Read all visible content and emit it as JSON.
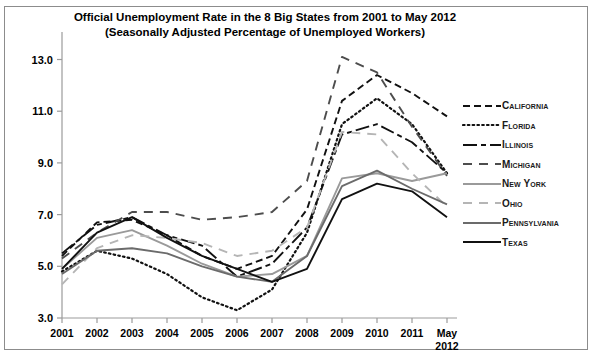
{
  "top_fragment": "",
  "chart_data": {
    "type": "line",
    "title": "Official Unemployment Rate in the 8 Big States from 2001 to May 2012",
    "subtitle": "(Seasonally Adjusted Percentage of Unemployed Workers)",
    "xlabel": "",
    "ylabel": "",
    "grid": false,
    "legend_position": "right",
    "categories": [
      "2001",
      "2002",
      "2003",
      "2004",
      "2005",
      "2006",
      "2007",
      "2008",
      "2009",
      "2010",
      "2011",
      "May\n2012"
    ],
    "x_tick_labels": [
      "2001",
      "2002",
      "2003",
      "2004",
      "2005",
      "2006",
      "2007",
      "2008",
      "2009",
      "2010",
      "2011",
      "May 2012"
    ],
    "y_tick_labels": [
      "3.0",
      "5.0",
      "7.0",
      "9.0",
      "11.0",
      "13.0"
    ],
    "y_ticks": [
      3.0,
      5.0,
      7.0,
      9.0,
      11.0,
      13.0
    ],
    "ylim": [
      3.0,
      13.6
    ],
    "series": [
      {
        "name": "California",
        "style": "dashed",
        "color": "#111111",
        "values": [
          5.4,
          6.7,
          6.8,
          6.2,
          5.4,
          4.9,
          5.4,
          7.2,
          11.4,
          12.4,
          11.7,
          10.8
        ]
      },
      {
        "name": "Florida",
        "style": "dotted",
        "color": "#111111",
        "values": [
          4.8,
          5.6,
          5.3,
          4.7,
          3.8,
          3.3,
          4.1,
          6.3,
          10.5,
          11.5,
          10.5,
          8.6
        ]
      },
      {
        "name": "Illinois",
        "style": "dash-dot",
        "color": "#111111",
        "values": [
          5.5,
          6.6,
          6.9,
          6.2,
          5.8,
          4.6,
          5.1,
          6.5,
          10.1,
          10.5,
          9.8,
          8.6
        ]
      },
      {
        "name": "Michigan",
        "style": "long-dash",
        "color": "#4d4d4d",
        "values": [
          5.3,
          6.3,
          7.1,
          7.1,
          6.8,
          6.9,
          7.1,
          8.3,
          13.1,
          12.5,
          10.4,
          8.5
        ]
      },
      {
        "name": "New York",
        "style": "solid",
        "color": "#9a9a9a",
        "values": [
          4.9,
          6.1,
          6.4,
          5.8,
          5.1,
          4.6,
          4.7,
          5.4,
          8.4,
          8.6,
          8.3,
          8.6
        ]
      },
      {
        "name": "Ohio",
        "style": "long-dash",
        "color": "#b5b5b5",
        "values": [
          4.3,
          5.7,
          6.2,
          6.1,
          5.9,
          5.4,
          5.6,
          6.5,
          10.2,
          10.1,
          8.6,
          7.3
        ]
      },
      {
        "name": "Pennsylvania",
        "style": "solid",
        "color": "#6b6b6b",
        "values": [
          4.7,
          5.6,
          5.7,
          5.5,
          5.0,
          4.6,
          4.4,
          5.4,
          8.1,
          8.7,
          8.0,
          7.4
        ]
      },
      {
        "name": "Texas",
        "style": "solid",
        "color": "#111111",
        "values": [
          4.9,
          6.3,
          6.9,
          6.1,
          5.4,
          4.9,
          4.4,
          4.9,
          7.6,
          8.2,
          7.9,
          6.9
        ]
      }
    ]
  }
}
